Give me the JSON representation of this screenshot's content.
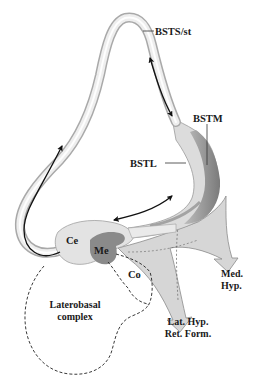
{
  "figure": {
    "title": "",
    "colors": {
      "background": "#ffffff",
      "tube_outer": "#bdbdbd",
      "tube_inner": "#f2f2f2",
      "tube_highlight": "#ffffff",
      "bstm_dark": "#8e8e8e",
      "bstl_light": "#dcdcdc",
      "nucleus_light": "#e3e3e3",
      "medial_nucleus": "#8a8a8a",
      "projection_fan": "#d6d6d6",
      "arrow": "#111111",
      "dashed_outline": "#222222",
      "text": "#1a1a1a"
    },
    "labels": {
      "bsts_st": "BSTS/st",
      "bstm": "BSTM",
      "bstl": "BSTL",
      "ce": "Ce",
      "me": "Me",
      "co": "Co",
      "laterobasal_line1": "Laterobasal",
      "laterobasal_line2": "complex",
      "med_hyp_line1": "Med.",
      "med_hyp_line2": "Hyp.",
      "lat_hyp_line1": "Lat. Hyp.",
      "lat_hyp_line2": "Ret. Form."
    }
  }
}
